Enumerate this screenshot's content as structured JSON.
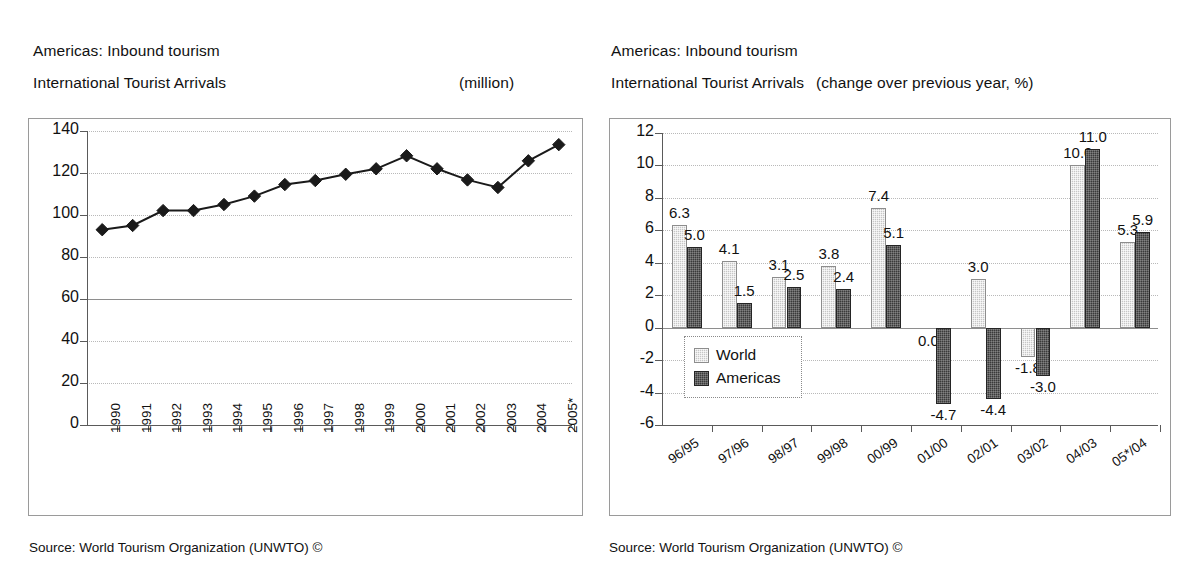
{
  "left_panel": {
    "title_line1": "Americas: Inbound tourism",
    "title_line2": "International Tourist Arrivals",
    "unit": "(million)",
    "source": "Source: World Tourism Organization (UNWTO) ©"
  },
  "right_panel": {
    "title_line1": "Americas: Inbound tourism",
    "title_line2": "International Tourist Arrivals",
    "unit": "(change over previous year, %)",
    "source": "Source: World Tourism Organization (UNWTO) ©"
  },
  "chart_data": [
    {
      "type": "line",
      "title": "Americas: Inbound tourism — International Tourist Arrivals",
      "ylabel": "",
      "xlabel": "",
      "unit": "million",
      "ylim": [
        0,
        140
      ],
      "yticks": [
        0,
        20,
        40,
        60,
        80,
        100,
        120,
        140
      ],
      "ytick_labels": [
        "0",
        "20",
        "40",
        "60",
        "80",
        "100",
        "120",
        "140"
      ],
      "grid": true,
      "legend": "none",
      "marker": "diamond",
      "categories": [
        "1990",
        "1991",
        "1992",
        "1993",
        "1994",
        "1995",
        "1996",
        "1997",
        "1998",
        "1999",
        "2000",
        "2001",
        "2002",
        "2003",
        "2004",
        "2005*"
      ],
      "values": [
        93.0,
        95.0,
        102.1,
        102.1,
        105.0,
        109.0,
        114.5,
        116.4,
        119.4,
        122.0,
        128.2,
        122.0,
        116.7,
        113.1,
        125.8,
        133.5
      ]
    },
    {
      "type": "bar",
      "title": "Americas: Inbound tourism — International Tourist Arrivals",
      "ylabel": "",
      "xlabel": "",
      "unit": "change over previous year, %",
      "ylim": [
        -6,
        12
      ],
      "yticks": [
        -6,
        -4,
        -2,
        0,
        2,
        4,
        6,
        8,
        10,
        12
      ],
      "ytick_labels": [
        "-6",
        "-4",
        "-2",
        "0",
        "2",
        "4",
        "6",
        "8",
        "10",
        "12"
      ],
      "grid": true,
      "legend_position": "inside-left",
      "categories": [
        "96/95",
        "97/96",
        "98/97",
        "99/98",
        "00/99",
        "01/00",
        "02/01",
        "03/02",
        "04/03",
        "05*/04"
      ],
      "series": [
        {
          "name": "World",
          "color": "#c6c6c6",
          "values": [
            6.3,
            4.1,
            3.1,
            3.8,
            7.4,
            0.0,
            3.0,
            -1.8,
            10.0,
            5.3
          ],
          "labels": [
            "6.3",
            "4.1",
            "3.1",
            "3.8",
            "7.4",
            "0.0",
            "3.0",
            "-1.8",
            "10.0",
            "5.3"
          ]
        },
        {
          "name": "Americas",
          "color": "#3a3a3a",
          "values": [
            5.0,
            1.5,
            2.5,
            2.4,
            5.1,
            -4.7,
            -4.4,
            -3.0,
            11.0,
            5.9
          ],
          "labels": [
            "5.0",
            "1.5",
            "2.5",
            "2.4",
            "5.1",
            "-4.7",
            "-4.4",
            "-3.0",
            "11.0",
            "5.9"
          ]
        }
      ]
    }
  ]
}
